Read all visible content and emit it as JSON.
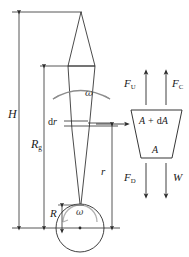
{
  "figure": {
    "kind": "engineering-diagram",
    "stroke_color": "#2b2b2b",
    "accent_gray": "#8d8d8d",
    "background": "#ffffff"
  },
  "dimensions": {
    "H": {
      "symbol": "H",
      "desc": "total hub-to-tip height dimension"
    },
    "Rg": {
      "symbol": "R",
      "subscript": "g",
      "desc": "blade radius dimension"
    },
    "R": {
      "symbol": "R",
      "desc": "hub radius dimension"
    },
    "r": {
      "symbol": "r",
      "desc": "local radial station dimension"
    }
  },
  "blade": {
    "element_label": "dr",
    "rotation_top": "ω",
    "rotation_hub": "ω"
  },
  "element_box": {
    "top_area_label": {
      "a": "A",
      "plus": "+",
      "da": "dA"
    },
    "bottom_area_label": "A"
  },
  "forces": {
    "up_left": {
      "symbol": "F",
      "subscript": "U",
      "direction": "up"
    },
    "up_right": {
      "symbol": "F",
      "subscript": "C",
      "direction": "up"
    },
    "down_left": {
      "symbol": "F",
      "subscript": "D",
      "direction": "down"
    },
    "down_right": {
      "symbol": "W",
      "subscript": "",
      "direction": "down"
    }
  }
}
